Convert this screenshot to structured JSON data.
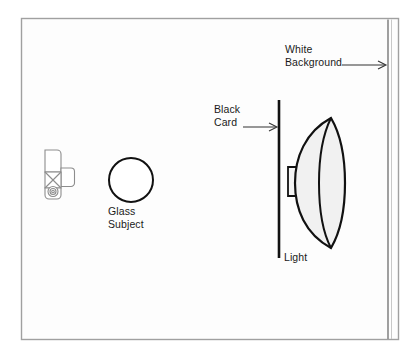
{
  "diagram": {
    "type": "photography-lighting-diagram",
    "canvas": {
      "width": 416,
      "height": 357,
      "background": "#ffffff"
    },
    "frame": {
      "name": "outer-frame",
      "x": 21,
      "y": 18,
      "width": 378,
      "height": 322,
      "stroke": "#9a9a9a",
      "fill": "#fcfcfc"
    },
    "labels": {
      "white_background": "White\nBackground",
      "black_card": "Black\nCard",
      "glass_subject": "Glass\nSubject",
      "light": "Light"
    },
    "elements": [
      {
        "id": "camera",
        "name": "camera-icon",
        "label": "",
        "x": 42,
        "y": 147,
        "width": 32,
        "height": 52,
        "stroke": "#8a8a8a",
        "fill": "#ffffff"
      },
      {
        "id": "glass-subject",
        "name": "glass-subject-circle",
        "label": "Glass Subject",
        "cx": 131,
        "cy": 180,
        "r": 22,
        "stroke": "#111111",
        "fill": "#ffffff"
      },
      {
        "id": "black-card",
        "name": "black-card-line",
        "label": "Black Card",
        "x": 279,
        "y1": 100,
        "y2": 258,
        "stroke": "#111111",
        "stroke_width": 2.4
      },
      {
        "id": "light",
        "name": "light-beauty-dish",
        "label": "Light",
        "cx": 322,
        "cy": 183,
        "top": 118,
        "bottom": 248,
        "stroke": "#111111",
        "fill": "#f2f2f2"
      },
      {
        "id": "white-background",
        "name": "white-background-line",
        "label": "White Background",
        "x": 388,
        "y1": 20,
        "y2": 338,
        "stroke": "#9a9a9a",
        "stroke_width": 1.6
      }
    ],
    "arrows": [
      {
        "id": "arrow-white-background",
        "name": "white-background-arrow",
        "x1": 342,
        "y1": 65,
        "x2": 387,
        "y2": 65
      },
      {
        "id": "arrow-black-card",
        "name": "black-card-arrow",
        "x1": 243,
        "y1": 127,
        "x2": 277,
        "y2": 127
      }
    ],
    "colors": {
      "ink": "#111111",
      "frame": "#9a9a9a",
      "fill_light": "#f2f2f2",
      "page": "#ffffff"
    }
  }
}
